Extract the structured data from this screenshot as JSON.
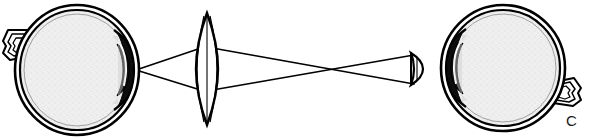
{
  "figure": {
    "panel_label": "C",
    "background_color": "#ffffff",
    "ink_color": "#000000",
    "sclera_fill": "#ffffff",
    "vitreous_fill": "#ececec",
    "iris_lens_fill": "#0d0d0d",
    "canvas": {
      "width": 591,
      "height": 139
    }
  },
  "elements": {
    "observer_eye": {
      "name": "Observer eye (left)",
      "center_x": 77,
      "center_y": 70,
      "radius_x": 62,
      "radius_y": 65,
      "orientation": "facing-right",
      "optic_nerve_side": "left",
      "parts": [
        "sclera",
        "vitreous",
        "crystalline-lens",
        "iris",
        "cornea",
        "optic-nerve"
      ]
    },
    "condensing_lens": {
      "name": "Condensing lens (biconvex)",
      "center_x": 207,
      "center_y": 69,
      "half_height": 56,
      "half_width": 11,
      "type": "biconvex"
    },
    "small_lens": {
      "name": "Small lens near patient eye",
      "center_x": 417,
      "center_y": 69,
      "half_height": 16,
      "half_width": 7,
      "type": "plano-convex"
    },
    "patient_eye": {
      "name": "Patient eye (right)",
      "center_x": 503,
      "center_y": 68,
      "radius_x": 62,
      "radius_y": 63,
      "orientation": "facing-left",
      "optic_nerve_side": "right",
      "parts": [
        "sclera",
        "vitreous",
        "crystalline-lens",
        "iris",
        "cornea",
        "optic-nerve"
      ]
    },
    "ray_bundle": {
      "name": "Light ray bundle",
      "left_node_x": 136,
      "left_node_y": 70,
      "lens_upper_y": 46,
      "lens_lower_y": 92,
      "crossover_x": 362,
      "crossover_y": 69,
      "right_node_upper_y": 55,
      "right_node_lower_y": 84,
      "ray_count": 4
    }
  }
}
